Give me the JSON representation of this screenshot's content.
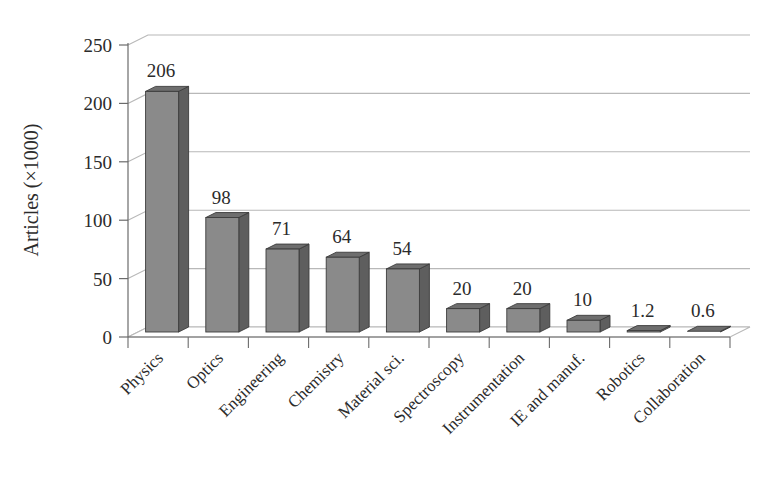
{
  "chart_data": {
    "type": "bar",
    "title": "",
    "subtitle": "",
    "xlabel": "",
    "ylabel": "Articles (×1000)",
    "categories": [
      "Physics",
      "Optics",
      "Engineering",
      "Chemistry",
      "Material sci.",
      "Spectroscopy",
      "Instrumentation",
      "IE and manuf.",
      "Robotics",
      "Collaboration"
    ],
    "values": [
      206,
      98,
      71,
      64,
      54,
      20,
      20,
      10,
      1.2,
      0.6
    ],
    "value_labels": [
      "206",
      "98",
      "71",
      "64",
      "54",
      "20",
      "20",
      "10",
      "1.2",
      "0.6"
    ],
    "ylim": [
      0,
      250
    ],
    "ytick_labels": [
      "0",
      "50",
      "100",
      "150",
      "200",
      "250"
    ],
    "yticks": [
      0,
      50,
      100,
      150,
      200,
      250
    ],
    "grid": true,
    "legend": false,
    "legend_position": "none",
    "style": "3d-bars",
    "colors": {
      "bar_front": "#8a8a8a",
      "bar_top": "#6e6e6e",
      "bar_side": "#5e5e5e",
      "bar_edge": "#3c3c3c",
      "grid": "#b8b8b8",
      "axis": "#6b6b6b",
      "text": "#2b2b2b",
      "background": "#ffffff"
    }
  }
}
